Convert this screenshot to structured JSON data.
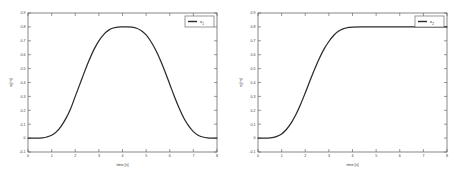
{
  "figure": {
    "background_color": "#ffffff",
    "line_color": "#2b2b2b",
    "axis_color": "#555555",
    "panel_count": 2
  },
  "chart_data": [
    {
      "type": "line",
      "title": "",
      "panel_name": "left-panel",
      "xlabel": "time [s]",
      "ylabel": "x₁ [m]",
      "ylabel_symbol": "x",
      "ylabel_subscript": "1",
      "ylabel_units": "[m]",
      "xlim": [
        0,
        8
      ],
      "ylim": [
        -0.1,
        0.9
      ],
      "xticks": [
        0,
        1,
        2,
        3,
        4,
        5,
        6,
        7,
        8
      ],
      "xticklabels": [
        "0",
        "1",
        "2",
        "3",
        "4",
        "5",
        "6",
        "7",
        "8"
      ],
      "yticks": [
        -0.1,
        0,
        0.1,
        0.2,
        0.3,
        0.4,
        0.5,
        0.6,
        0.7,
        0.8,
        0.9
      ],
      "yticklabels": [
        "-0.1",
        "0",
        "0.1",
        "0.2",
        "0.3",
        "0.4",
        "0.5",
        "0.6",
        "0.7",
        "0.8",
        "0.9"
      ],
      "grid": false,
      "legend_position": "upper right",
      "legend": [
        "x₁"
      ],
      "series": [
        {
          "name": "x₁",
          "color": "#2b2b2b",
          "x": [
            0.0,
            0.2,
            0.4,
            0.6,
            0.8,
            1.0,
            1.2,
            1.4,
            1.6,
            1.8,
            2.0,
            2.2,
            2.4,
            2.6,
            2.8,
            3.0,
            3.2,
            3.4,
            3.6,
            3.8,
            4.0,
            4.2,
            4.4,
            4.6,
            4.8,
            5.0,
            5.2,
            5.4,
            5.6,
            5.8,
            6.0,
            6.2,
            6.4,
            6.6,
            6.8,
            7.0,
            7.2,
            7.4,
            7.6,
            7.8,
            8.0
          ],
          "y": [
            0.0,
            0.0,
            0.0,
            0.002,
            0.008,
            0.02,
            0.045,
            0.085,
            0.14,
            0.21,
            0.3,
            0.39,
            0.48,
            0.565,
            0.64,
            0.7,
            0.745,
            0.775,
            0.792,
            0.799,
            0.8,
            0.8,
            0.798,
            0.79,
            0.772,
            0.742,
            0.695,
            0.635,
            0.562,
            0.478,
            0.388,
            0.298,
            0.215,
            0.143,
            0.088,
            0.047,
            0.021,
            0.008,
            0.002,
            0.0,
            0.0
          ]
        }
      ]
    },
    {
      "type": "line",
      "title": "",
      "panel_name": "right-panel",
      "xlabel": "time [s]",
      "ylabel": "x₂ [m]",
      "ylabel_symbol": "x",
      "ylabel_subscript": "2",
      "ylabel_units": "[m]",
      "xlim": [
        0,
        8
      ],
      "ylim": [
        -0.1,
        0.9
      ],
      "xticks": [
        0,
        1,
        2,
        3,
        4,
        5,
        6,
        7,
        8
      ],
      "xticklabels": [
        "0",
        "1",
        "2",
        "3",
        "4",
        "5",
        "6",
        "7",
        "8"
      ],
      "yticks": [
        -0.1,
        0,
        0.1,
        0.2,
        0.3,
        0.4,
        0.5,
        0.6,
        0.7,
        0.8,
        0.9
      ],
      "yticklabels": [
        "-0.1",
        "0",
        "0.1",
        "0.2",
        "0.3",
        "0.4",
        "0.5",
        "0.6",
        "0.7",
        "0.8",
        "0.9"
      ],
      "grid": false,
      "legend_position": "upper right",
      "legend": [
        "x₂"
      ],
      "series": [
        {
          "name": "x₂",
          "color": "#2b2b2b",
          "x": [
            0.0,
            0.2,
            0.4,
            0.6,
            0.8,
            1.0,
            1.2,
            1.4,
            1.6,
            1.8,
            2.0,
            2.2,
            2.4,
            2.6,
            2.8,
            3.0,
            3.2,
            3.4,
            3.6,
            3.8,
            4.0,
            4.5,
            5.0,
            5.5,
            6.0,
            6.5,
            7.0,
            7.5,
            8.0
          ],
          "y": [
            0.0,
            0.0,
            0.0,
            0.003,
            0.012,
            0.03,
            0.062,
            0.108,
            0.168,
            0.242,
            0.325,
            0.412,
            0.497,
            0.575,
            0.642,
            0.695,
            0.738,
            0.768,
            0.786,
            0.795,
            0.799,
            0.8,
            0.8,
            0.8,
            0.8,
            0.8,
            0.8,
            0.8,
            0.8
          ]
        }
      ]
    }
  ]
}
